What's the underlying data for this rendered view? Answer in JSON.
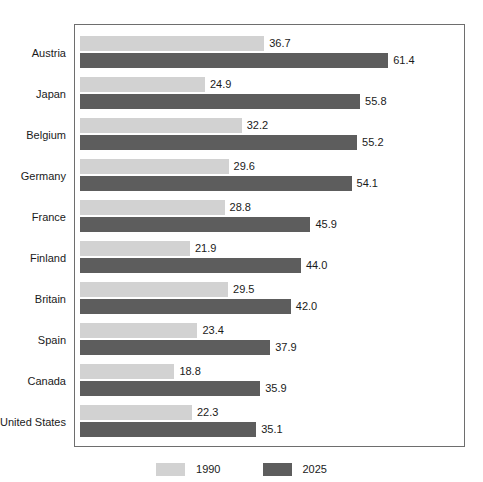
{
  "chart_data": {
    "type": "bar",
    "orientation": "horizontal",
    "title": "",
    "xlabel": "",
    "ylabel": "",
    "grid": false,
    "legend_position": "bottom-center",
    "xlim": [
      0,
      61.4
    ],
    "categories": [
      "Austria",
      "Japan",
      "Belgium",
      "Germany",
      "France",
      "Finland",
      "Britain",
      "Spain",
      "Canada",
      "United States"
    ],
    "series": [
      {
        "name": "1990",
        "color": "#d2d2d2",
        "values": [
          36.7,
          24.9,
          32.2,
          29.6,
          28.8,
          21.9,
          29.5,
          23.4,
          18.8,
          22.3
        ],
        "value_labels": [
          "36.7",
          "24.9",
          "32.2",
          "29.6",
          "28.8",
          "21.9",
          "29.5",
          "23.4",
          "18.8",
          "22.3"
        ]
      },
      {
        "name": "2025",
        "color": "#5d5d5d",
        "values": [
          61.4,
          55.8,
          55.2,
          54.1,
          45.9,
          44.0,
          42.0,
          37.9,
          35.9,
          35.1
        ],
        "value_labels": [
          "61.4",
          "55.8",
          "55.2",
          "54.1",
          "45.9",
          "44.0",
          "42.0",
          "37.9",
          "35.9",
          "35.1"
        ]
      }
    ]
  },
  "legend": {
    "items": [
      {
        "label": "1990",
        "color": "#d2d2d2"
      },
      {
        "label": "2025",
        "color": "#5d5d5d"
      }
    ]
  },
  "colors": {
    "series_1990": "#d2d2d2",
    "series_2025": "#5d5d5d",
    "plot_border": "#6e6e6e",
    "text": "#1a1a1a",
    "background": "#ffffff"
  }
}
